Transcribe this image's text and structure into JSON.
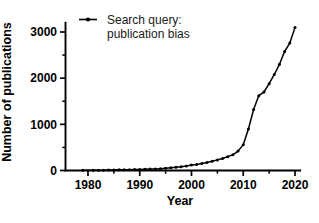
{
  "chart_data": {
    "type": "line",
    "title": "",
    "subtitle": "",
    "xlabel": "Year",
    "ylabel": "Number of publications",
    "xlim": [
      1975,
      2021
    ],
    "ylim": [
      0,
      3200
    ],
    "grid": false,
    "legend_position": "top-left-inside",
    "x_major_ticks": [
      1980,
      1990,
      2000,
      2010,
      2020
    ],
    "x_major_tick_labels": [
      "1980",
      "1990",
      "2000",
      "2010",
      "2020"
    ],
    "x_minor_ticks": [
      1985,
      1995,
      2005,
      2015
    ],
    "y_major_ticks": [
      0,
      1000,
      2000,
      3000
    ],
    "y_major_tick_labels": [
      "0",
      "1000",
      "2000",
      "3000"
    ],
    "y_minor_ticks": [
      500,
      1500,
      2500
    ],
    "series": [
      {
        "name": "Search query: publication bias",
        "legend_label_line1": "Search query:",
        "legend_label_line2": "publication bias",
        "marker": "filled-circle",
        "color": "#000000",
        "x": [
          1979,
          1981,
          1982,
          1983,
          1984,
          1985,
          1986,
          1987,
          1988,
          1989,
          1990,
          1991,
          1992,
          1993,
          1994,
          1995,
          1996,
          1997,
          1998,
          1999,
          2000,
          2001,
          2002,
          2003,
          2004,
          2005,
          2006,
          2007,
          2008,
          2009,
          2010,
          2011,
          2012,
          2013,
          2014,
          2015,
          2016,
          2017,
          2018,
          2019,
          2020
        ],
        "y": [
          4,
          6,
          8,
          7,
          10,
          12,
          14,
          16,
          18,
          20,
          24,
          26,
          30,
          34,
          40,
          48,
          58,
          70,
          82,
          96,
          120,
          130,
          150,
          175,
          200,
          230,
          260,
          300,
          340,
          420,
          560,
          900,
          1320,
          1620,
          1700,
          1880,
          2080,
          2300,
          2580,
          2760,
          3100
        ]
      }
    ]
  },
  "legend": {
    "line1": "Search query:",
    "line2": "publication bias"
  },
  "axes": {
    "x_title": "Year",
    "y_title": "Number of publications"
  }
}
